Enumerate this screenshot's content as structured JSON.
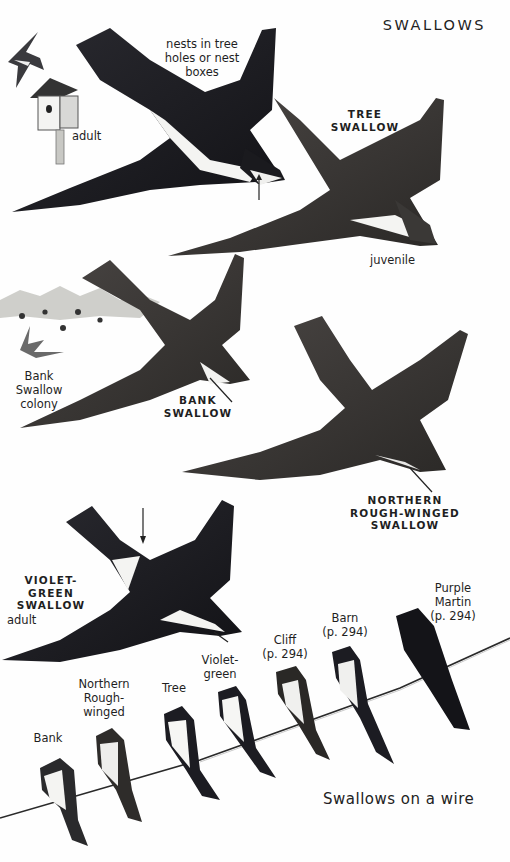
{
  "page": {
    "title": "SWALLOWS",
    "colors": {
      "background": "#fefefe",
      "ink": "#1f1f1f",
      "bird_dark": "#1c1c22",
      "bird_brown": "#3b3836",
      "underparts": "#f4f4f2",
      "wire": "#2a2a2a"
    }
  },
  "tree_swallow": {
    "name": "TREE SWALLOW",
    "name_line1": "TREE",
    "name_line2": "SWALLOW",
    "habitat_note_line1": "nests in tree",
    "habitat_note_line2": "holes or nest",
    "habitat_note_line3": "boxes",
    "adult_label": "adult",
    "juvenile_label": "juvenile"
  },
  "bank_swallow": {
    "name_line1": "BANK",
    "name_line2": "SWALLOW",
    "colony_line1": "Bank Swallow",
    "colony_line2": "colony"
  },
  "rough_winged": {
    "name_line1": "NORTHERN",
    "name_line2": "ROUGH-WINGED",
    "name_line3": "SWALLOW"
  },
  "violet_green": {
    "name_line1": "VIOLET-GREEN",
    "name_line2": "SWALLOW",
    "adult_label": "adult"
  },
  "wire": {
    "caption": "Swallows on a wire",
    "birds": [
      {
        "line1": "Bank",
        "line2": "",
        "line3": ""
      },
      {
        "line1": "Northern",
        "line2": "Rough-",
        "line3": "winged"
      },
      {
        "line1": "Tree",
        "line2": "",
        "line3": ""
      },
      {
        "line1": "Violet-",
        "line2": "green",
        "line3": ""
      },
      {
        "line1": "Cliff",
        "line2": "(p. 294)",
        "line3": ""
      },
      {
        "line1": "Barn",
        "line2": "(p. 294)",
        "line3": ""
      },
      {
        "line1": "Purple",
        "line2": "Martin",
        "line3": "(p. 294)"
      }
    ]
  }
}
